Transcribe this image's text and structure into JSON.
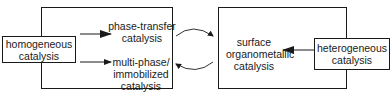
{
  "nodes": {
    "homogeneous": {
      "line1": "homogeneous",
      "line2": "catalysis"
    },
    "phase_transfer": {
      "line1": "phase-transfer",
      "line2": "catalysis"
    },
    "multi_phase": {
      "line1": "multi-phase/",
      "line2": "immobilized",
      "line3": "catalysis"
    },
    "surface_organometallic": {
      "line1": "surface",
      "line2": "organometallic",
      "line3": "catalysis"
    },
    "heterogeneous": {
      "line1": "heterogeneous",
      "line2": "catalysis"
    }
  },
  "edges": [
    {
      "from": "homogeneous",
      "to": "phase_transfer",
      "style": "straight-arrow"
    },
    {
      "from": "homogeneous",
      "to": "multi_phase",
      "style": "straight-arrow"
    },
    {
      "from": "heterogeneous",
      "to": "surface_organometallic",
      "style": "straight-arrow"
    },
    {
      "from": "left-group",
      "to": "right-group",
      "style": "curved-arrow"
    },
    {
      "from": "right-group",
      "to": "left-group",
      "style": "curved-arrow"
    }
  ],
  "colors": {
    "stroke": "#1a1a1a",
    "background": "#ffffff"
  }
}
